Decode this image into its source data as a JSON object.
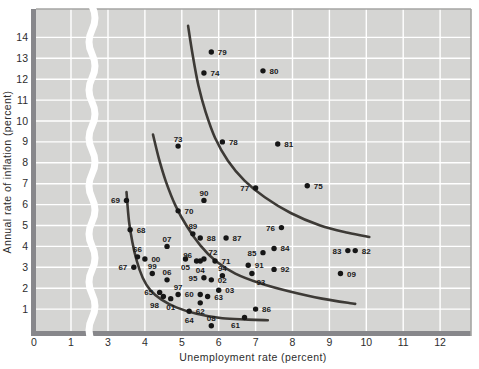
{
  "figure": {
    "width": 479,
    "height": 369
  },
  "chart_data": {
    "type": "scatter",
    "title": "",
    "xlabel": "Unemployment rate (percent)",
    "ylabel": "Annual rate of inflation (percent)",
    "xlim": [
      0,
      12.8
    ],
    "ylim": [
      0,
      15.3
    ],
    "grid": true,
    "x_ticks": [
      0,
      1,
      3,
      4,
      5,
      6,
      7,
      8,
      9,
      10,
      11,
      12
    ],
    "y_ticks": [
      1,
      2,
      3,
      4,
      5,
      6,
      7,
      8,
      9,
      10,
      11,
      12,
      13,
      14
    ],
    "x_grid_at": [
      1,
      3,
      4,
      5,
      6,
      7,
      8,
      9,
      10,
      11,
      12
    ],
    "axis_break": {
      "axis": "x",
      "between": [
        1,
        3
      ]
    },
    "points": [
      {
        "label": "60",
        "x": 5.5,
        "y": 1.7,
        "pos": "l"
      },
      {
        "label": "61",
        "x": 6.7,
        "y": 0.6,
        "pos": "bl"
      },
      {
        "label": "62",
        "x": 5.5,
        "y": 1.3,
        "pos": "b"
      },
      {
        "label": "63",
        "x": 5.7,
        "y": 1.6,
        "pos": "r"
      },
      {
        "label": "64",
        "x": 5.2,
        "y": 0.9,
        "pos": "b"
      },
      {
        "label": "65",
        "x": 4.4,
        "y": 1.8,
        "pos": "l"
      },
      {
        "label": "66",
        "x": 3.8,
        "y": 3.5,
        "pos": "a"
      },
      {
        "label": "67",
        "x": 3.7,
        "y": 3.0,
        "pos": "l"
      },
      {
        "label": "68",
        "x": 3.6,
        "y": 4.8,
        "pos": "r"
      },
      {
        "label": "69",
        "x": 3.5,
        "y": 6.2,
        "pos": "l"
      },
      {
        "label": "70",
        "x": 4.9,
        "y": 5.7,
        "pos": "r"
      },
      {
        "label": "71",
        "x": 5.9,
        "y": 3.3,
        "pos": "r"
      },
      {
        "label": "72",
        "x": 5.6,
        "y": 3.4,
        "pos": "ar"
      },
      {
        "label": "73",
        "x": 4.9,
        "y": 8.8,
        "pos": "a"
      },
      {
        "label": "74",
        "x": 5.6,
        "y": 12.3,
        "pos": "r"
      },
      {
        "label": "75",
        "x": 8.4,
        "y": 6.9,
        "pos": "r"
      },
      {
        "label": "76",
        "x": 7.7,
        "y": 4.9,
        "pos": "l"
      },
      {
        "label": "77",
        "x": 7.0,
        "y": 6.8,
        "pos": "l"
      },
      {
        "label": "78",
        "x": 6.1,
        "y": 9.0,
        "pos": "r"
      },
      {
        "label": "79",
        "x": 5.8,
        "y": 13.3,
        "pos": "r"
      },
      {
        "label": "80",
        "x": 7.2,
        "y": 12.4,
        "pos": "r"
      },
      {
        "label": "81",
        "x": 7.6,
        "y": 8.9,
        "pos": "r"
      },
      {
        "label": "82",
        "x": 9.7,
        "y": 3.8,
        "pos": "r"
      },
      {
        "label": "83",
        "x": 9.5,
        "y": 3.8,
        "pos": "l"
      },
      {
        "label": "84",
        "x": 7.5,
        "y": 3.9,
        "pos": "r"
      },
      {
        "label": "85",
        "x": 7.2,
        "y": 3.7,
        "pos": "l"
      },
      {
        "label": "86",
        "x": 7.0,
        "y": 1.0,
        "pos": "r"
      },
      {
        "label": "87",
        "x": 6.2,
        "y": 4.4,
        "pos": "r"
      },
      {
        "label": "88",
        "x": 5.5,
        "y": 4.4,
        "pos": "r"
      },
      {
        "label": "89",
        "x": 5.3,
        "y": 4.6,
        "pos": "a"
      },
      {
        "label": "90",
        "x": 5.6,
        "y": 6.2,
        "pos": "a"
      },
      {
        "label": "91",
        "x": 6.8,
        "y": 3.1,
        "pos": "r"
      },
      {
        "label": "92",
        "x": 7.5,
        "y": 2.9,
        "pos": "r"
      },
      {
        "label": "93",
        "x": 6.9,
        "y": 2.7,
        "pos": "br"
      },
      {
        "label": "94",
        "x": 6.1,
        "y": 2.6,
        "pos": "a"
      },
      {
        "label": "95",
        "x": 5.6,
        "y": 2.5,
        "pos": "l"
      },
      {
        "label": "96",
        "x": 5.4,
        "y": 3.3,
        "pos": "al"
      },
      {
        "label": "97",
        "x": 4.9,
        "y": 1.7,
        "pos": "a"
      },
      {
        "label": "98",
        "x": 4.5,
        "y": 1.6,
        "pos": "bl"
      },
      {
        "label": "99",
        "x": 4.2,
        "y": 2.7,
        "pos": "a"
      },
      {
        "label": "00",
        "x": 4.0,
        "y": 3.4,
        "pos": "r"
      },
      {
        "label": "01",
        "x": 4.7,
        "y": 1.5,
        "pos": "b"
      },
      {
        "label": "02",
        "x": 5.8,
        "y": 2.4,
        "pos": "r"
      },
      {
        "label": "03",
        "x": 6.0,
        "y": 1.9,
        "pos": "r"
      },
      {
        "label": "04",
        "x": 5.5,
        "y": 3.3,
        "pos": "b"
      },
      {
        "label": "05",
        "x": 5.1,
        "y": 3.4,
        "pos": "b"
      },
      {
        "label": "06",
        "x": 4.6,
        "y": 2.4,
        "pos": "a"
      },
      {
        "label": "07",
        "x": 4.6,
        "y": 4.0,
        "pos": "a"
      },
      {
        "label": "08",
        "x": 5.8,
        "y": 0.2,
        "pos": "a"
      },
      {
        "label": "09",
        "x": 9.3,
        "y": 2.7,
        "pos": "r"
      }
    ],
    "curves": [
      {
        "name": "phillips-curve-1960s",
        "points": [
          [
            3.5,
            6.6
          ],
          [
            3.57,
            5.2
          ],
          [
            3.66,
            4.2
          ],
          [
            3.78,
            3.3
          ],
          [
            3.94,
            2.5
          ],
          [
            4.14,
            1.92
          ],
          [
            4.45,
            1.45
          ],
          [
            4.85,
            1.08
          ],
          [
            5.4,
            0.78
          ],
          [
            6.1,
            0.56
          ],
          [
            6.8,
            0.5
          ],
          [
            7.33,
            0.47
          ]
        ]
      },
      {
        "name": "phillips-curve-middle",
        "points": [
          [
            4.22,
            9.35
          ],
          [
            4.38,
            8.2
          ],
          [
            4.57,
            7.1
          ],
          [
            4.83,
            5.95
          ],
          [
            5.14,
            4.95
          ],
          [
            5.5,
            4.05
          ],
          [
            5.92,
            3.3
          ],
          [
            6.45,
            2.7
          ],
          [
            7.1,
            2.25
          ],
          [
            7.9,
            1.85
          ],
          [
            8.8,
            1.5
          ],
          [
            9.7,
            1.25
          ]
        ]
      },
      {
        "name": "phillips-curve-1970s",
        "points": [
          [
            5.17,
            14.55
          ],
          [
            5.3,
            13.1
          ],
          [
            5.45,
            11.7
          ],
          [
            5.65,
            10.4
          ],
          [
            5.9,
            9.2
          ],
          [
            6.25,
            8.1
          ],
          [
            6.7,
            7.15
          ],
          [
            7.25,
            6.35
          ],
          [
            7.95,
            5.6
          ],
          [
            8.75,
            5.0
          ],
          [
            9.5,
            4.65
          ],
          [
            10.08,
            4.45
          ]
        ]
      }
    ],
    "legend": null
  },
  "colors": {
    "page_bg": "#ffffff",
    "plot_bg": "#d5d5d3",
    "grid": "#ffffff",
    "border_dark": "#87878b",
    "border_light": "#a5a5a3",
    "curve": "#3d3a36",
    "dot": "#161616",
    "point_label": "#1a1a1a",
    "axis_text": "#2d2d2d"
  }
}
